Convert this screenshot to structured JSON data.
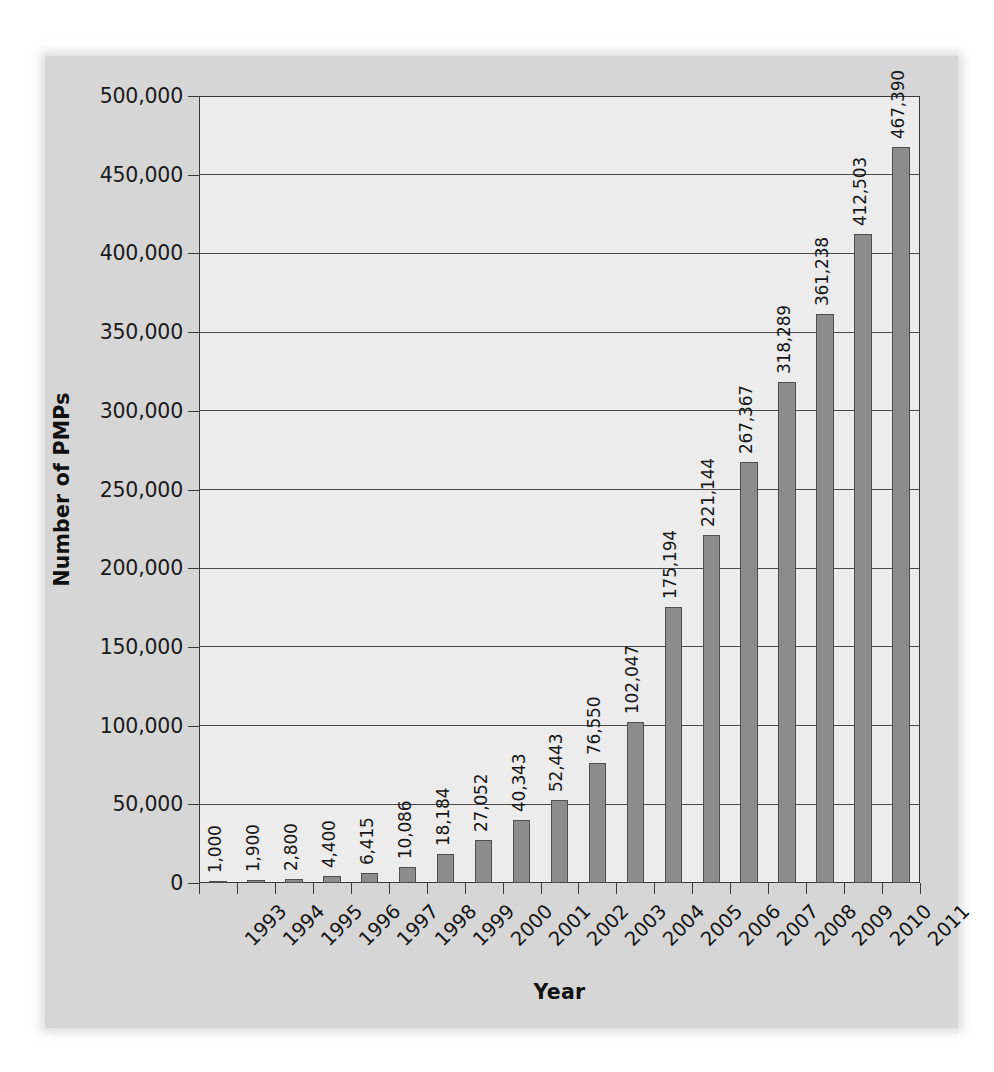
{
  "chart_data": {
    "type": "bar",
    "title": "",
    "xlabel": "Year",
    "ylabel": "Number of PMPs",
    "categories": [
      "1993",
      "1994",
      "1995",
      "1996",
      "1997",
      "1998",
      "1999",
      "2000",
      "2001",
      "2002",
      "2003",
      "2004",
      "2005",
      "2006",
      "2007",
      "2008",
      "2009",
      "2010",
      "2011"
    ],
    "values": [
      1000,
      1900,
      2800,
      4400,
      6415,
      10086,
      18184,
      27052,
      40343,
      52443,
      76550,
      102047,
      175194,
      221144,
      267367,
      318289,
      361238,
      412503,
      467390
    ],
    "value_labels": [
      "1,000",
      "1,900",
      "2,800",
      "4,400",
      "6,415",
      "10,086",
      "18,184",
      "27,052",
      "40,343",
      "52,443",
      "76,550",
      "102,047",
      "175,194",
      "221,144",
      "267,367",
      "318,289",
      "361,238",
      "412,503",
      "467,390"
    ],
    "ylim": [
      0,
      500000
    ],
    "yticks": [
      0,
      50000,
      100000,
      150000,
      200000,
      250000,
      300000,
      350000,
      400000,
      450000,
      500000
    ],
    "ytick_labels": [
      "0",
      "50,000",
      "100,000",
      "150,000",
      "200,000",
      "250,000",
      "300,000",
      "350,000",
      "400,000",
      "450,000",
      "500,000"
    ],
    "grid": "horizontal",
    "legend": "none",
    "bar_color": "#8c8c8c",
    "bar_border_color": "#4f4f4f",
    "plot_background": "#ececec",
    "panel_background": "#d6d6d6",
    "axis_color": "#3a3a3a",
    "gridline_color": "#4a4a4a",
    "text_color": "#141414"
  }
}
